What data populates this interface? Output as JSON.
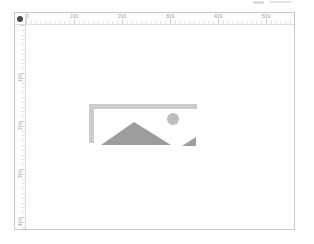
{
  "window": {
    "background": "#ffffff",
    "cropped_fragment_color": "#dcdcdc"
  },
  "artboard": {
    "background": "#ffffff",
    "border_color": "#c8c8c8"
  },
  "rulers": {
    "origin_icon": "ruler-origin-dot",
    "text_color": "#a6a6a6",
    "tick_color": "#e4e4e4",
    "major_tick_color": "#cfcfcf",
    "top_labels": [
      "0",
      "100",
      "200",
      "300",
      "400",
      "500"
    ],
    "left_labels": [
      "100",
      "200",
      "300",
      "400"
    ]
  },
  "placeholder": {
    "icon": "broken-image-placeholder",
    "colors": {
      "frame": "#cccccc",
      "mountain": "#9d9d9d",
      "sun": "#bdbdbd",
      "torn_corner": "#9d9d9d"
    }
  }
}
